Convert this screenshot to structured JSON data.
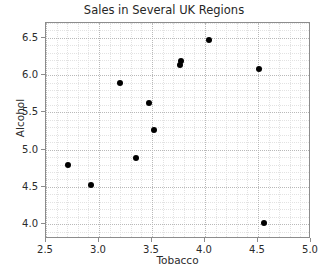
{
  "chart_data": {
    "type": "scatter",
    "title": "Sales in Several UK Regions",
    "xlabel": "Tobacco",
    "ylabel": "Alcohol",
    "xlim": [
      2.5,
      5.0
    ],
    "ylim": [
      3.8,
      6.7
    ],
    "grid": true,
    "legend": null,
    "marker_color": "#000000",
    "x_ticks": [
      "2.5",
      "3.0",
      "3.5",
      "4.0",
      "4.5",
      "5.0"
    ],
    "x_tick_values": [
      2.5,
      3.0,
      3.5,
      4.0,
      4.5,
      5.0
    ],
    "y_ticks": [
      "4.0",
      "4.5",
      "5.0",
      "5.5",
      "6.0",
      "6.5"
    ],
    "y_tick_values": [
      4.0,
      4.5,
      5.0,
      5.5,
      6.0,
      6.5
    ],
    "points": [
      {
        "x": 2.71,
        "y": 4.79
      },
      {
        "x": 2.92,
        "y": 4.52
      },
      {
        "x": 3.2,
        "y": 5.89
      },
      {
        "x": 3.35,
        "y": 4.89
      },
      {
        "x": 3.47,
        "y": 5.63
      },
      {
        "x": 3.52,
        "y": 5.27
      },
      {
        "x": 3.76,
        "y": 6.13
      },
      {
        "x": 3.77,
        "y": 6.19
      },
      {
        "x": 4.04,
        "y": 6.47
      },
      {
        "x": 4.51,
        "y": 6.08
      },
      {
        "x": 4.56,
        "y": 4.02
      }
    ]
  }
}
